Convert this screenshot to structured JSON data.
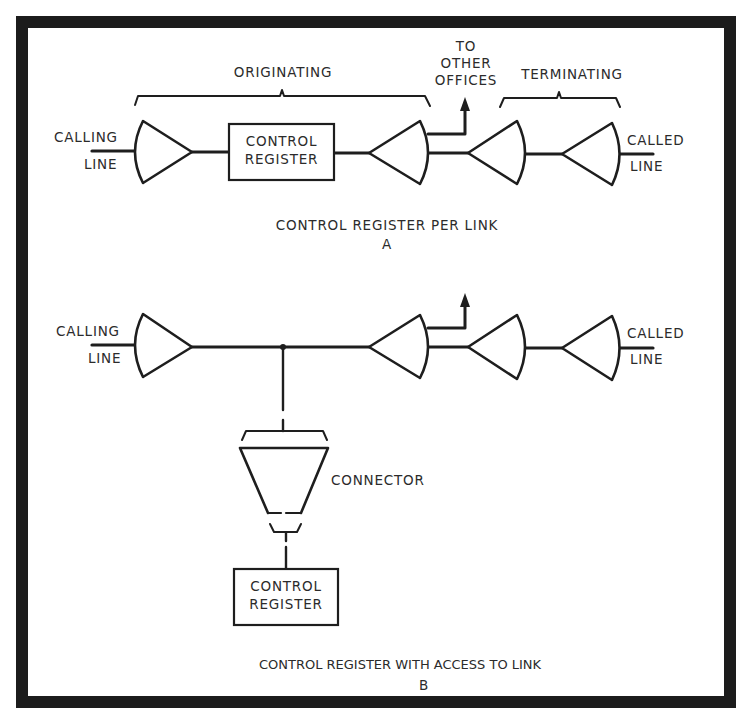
{
  "figure": {
    "frame_color": "#1c1c1c",
    "background": "#ffffff",
    "line_color": "#1e1e1e"
  },
  "diagram_a": {
    "bracket_originating": "ORIGINATING",
    "bracket_terminating": "TERMINATING",
    "branch_label_line1": "TO",
    "branch_label_line2": "OTHER",
    "branch_label_line3": "OFFICES",
    "calling_line_1": "CALLING",
    "calling_line_2": "LINE",
    "called_line_1": "CALLED",
    "called_line_2": "LINE",
    "register_line1": "CONTROL",
    "register_line2": "REGISTER",
    "caption": "CONTROL REGISTER PER LINK",
    "caption_letter": "A"
  },
  "diagram_b": {
    "calling_line_1": "CALLING",
    "calling_line_2": "LINE",
    "called_line_1": "CALLED",
    "called_line_2": "LINE",
    "connector_label": "CONNECTOR",
    "register_line1": "CONTROL",
    "register_line2": "REGISTER",
    "caption": "CONTROL REGISTER WITH ACCESS TO LINK",
    "caption_letter": "B"
  }
}
